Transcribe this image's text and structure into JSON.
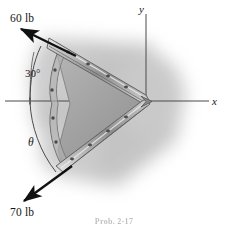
{
  "figure": {
    "caption": "Prob. 2-17",
    "background_color": "#ffffff",
    "shadow_color": "#9a9a9a",
    "ink_color": "#161616",
    "metal_light": "#d8d8d8",
    "metal_mid": "#a8a8a8",
    "metal_dark": "#6e6e6e"
  },
  "axes": {
    "x_label": "x",
    "y_label": "y",
    "origin_label": "O",
    "color": "#555555"
  },
  "forces": [
    {
      "name": "upper-force",
      "label": "60 lb",
      "magnitude": 60,
      "unit": "lb",
      "direction": "up-left",
      "angle_from_vertical_deg": 30
    },
    {
      "name": "lower-force",
      "label": "70 lb",
      "magnitude": 70,
      "unit": "lb",
      "direction": "down-left",
      "angle_symbol": "θ"
    }
  ],
  "angles": [
    {
      "name": "angle-30",
      "label": "30°",
      "value": 30,
      "unit": "deg",
      "measured_from": "vertical reference line"
    },
    {
      "name": "angle-theta",
      "label": "θ",
      "value": null,
      "unit": "deg",
      "measured_from": "negative x-axis"
    }
  ]
}
